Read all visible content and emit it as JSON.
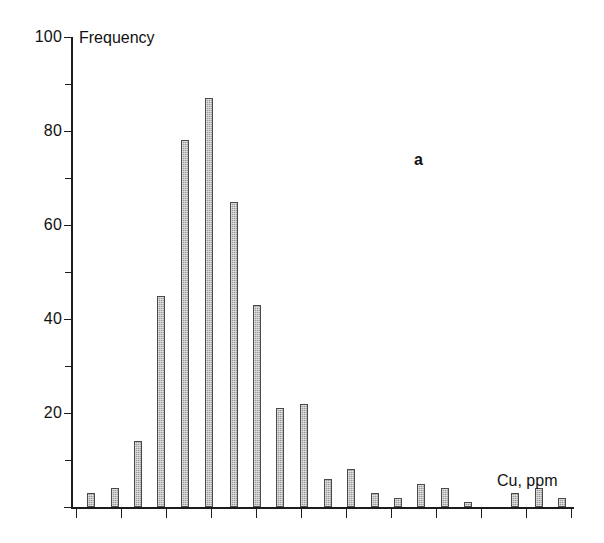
{
  "figure": {
    "panel_label": "a",
    "width": 604,
    "height": 543,
    "background": "#ffffff",
    "bar_fill_color": "#9a9a9a",
    "bar_edge_color": "#4a4a4a",
    "axis_color": "#1c1c1c"
  },
  "chart_data": {
    "type": "bar",
    "title": "",
    "subtitle": "",
    "xlabel": "Cu, ppm",
    "ylabel": "Frequency",
    "ylim": [
      0,
      100
    ],
    "y_major_ticks": [
      0,
      20,
      40,
      60,
      80,
      100
    ],
    "y_minor_ticks": [
      10,
      30,
      50,
      70,
      90
    ],
    "y_tick_labels": [
      "20",
      "40",
      "60",
      "80",
      "100"
    ],
    "x_tick_labels": [],
    "x_axis_labeled": false,
    "x_major_tick_count": 12,
    "grid": false,
    "legend": null,
    "annotations": [
      {
        "text": "a",
        "role": "panel-label"
      },
      {
        "text": "Frequency",
        "role": "y-axis-title"
      },
      {
        "text": "Cu, ppm",
        "role": "x-axis-title"
      }
    ],
    "bin_index": [
      1,
      2,
      3,
      4,
      5,
      6,
      7,
      8,
      9,
      10,
      11,
      12,
      13,
      14,
      15,
      16,
      17,
      18,
      19,
      20,
      21,
      22,
      23,
      24
    ],
    "values": [
      3,
      4,
      14,
      45,
      78,
      87,
      65,
      43,
      21,
      22,
      6,
      8,
      3,
      2,
      5,
      4,
      1,
      0,
      3,
      4,
      2,
      0,
      0,
      0
    ],
    "categories": [
      "1",
      "2",
      "3",
      "4",
      "5",
      "6",
      "7",
      "8",
      "9",
      "10",
      "11",
      "12",
      "13",
      "14",
      "15",
      "16",
      "17",
      "18",
      "19",
      "20",
      "21",
      "22",
      "23",
      "24"
    ],
    "bars": [
      {
        "index": 1,
        "value": 3,
        "x_px": 87
      },
      {
        "index": 2,
        "value": 4,
        "x_px": 111
      },
      {
        "index": 3,
        "value": 14,
        "x_px": 134
      },
      {
        "index": 4,
        "value": 45,
        "x_px": 157
      },
      {
        "index": 5,
        "value": 78,
        "x_px": 181
      },
      {
        "index": 6,
        "value": 87,
        "x_px": 205
      },
      {
        "index": 7,
        "value": 65,
        "x_px": 230
      },
      {
        "index": 8,
        "value": 43,
        "x_px": 253
      },
      {
        "index": 9,
        "value": 21,
        "x_px": 276
      },
      {
        "index": 10,
        "value": 22,
        "x_px": 300
      },
      {
        "index": 11,
        "value": 6,
        "x_px": 324
      },
      {
        "index": 12,
        "value": 8,
        "x_px": 347
      },
      {
        "index": 13,
        "value": 3,
        "x_px": 371
      },
      {
        "index": 14,
        "value": 2,
        "x_px": 394
      },
      {
        "index": 15,
        "value": 5,
        "x_px": 417
      },
      {
        "index": 16,
        "value": 4,
        "x_px": 441
      },
      {
        "index": 17,
        "value": 1,
        "x_px": 464
      },
      {
        "index": 19,
        "value": 3,
        "x_px": 511
      },
      {
        "index": 20,
        "value": 4,
        "x_px": 535
      },
      {
        "index": 21,
        "value": 2,
        "x_px": 558
      }
    ]
  }
}
